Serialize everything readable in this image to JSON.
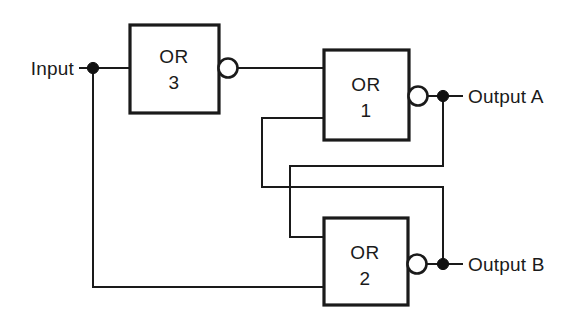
{
  "diagram": {
    "type": "logic-circuit",
    "background_color": "#ffffff",
    "line_color": "#1a1a1a",
    "gates": [
      {
        "id": "or3",
        "label_line1": "OR",
        "label_line2": "3",
        "x": 130,
        "y": 25,
        "width": 89,
        "height": 88,
        "inverting_output": true,
        "inputs": 1
      },
      {
        "id": "or1",
        "label_line1": "OR",
        "label_line2": "1",
        "x": 324,
        "y": 50,
        "width": 85,
        "height": 90,
        "inverting_output": true,
        "inputs": 2
      },
      {
        "id": "or2",
        "label_line1": "OR",
        "label_line2": "2",
        "x": 324,
        "y": 218,
        "width": 84,
        "height": 87,
        "inverting_output": true,
        "inputs": 2
      }
    ],
    "ports": [
      {
        "id": "input",
        "label": "Input",
        "side": "left",
        "x": 80,
        "y": 68
      },
      {
        "id": "output_a",
        "label": "Output A",
        "side": "right",
        "x": 468,
        "y": 96
      },
      {
        "id": "output_b",
        "label": "Output B",
        "side": "right",
        "x": 468,
        "y": 264
      }
    ],
    "junctions": [
      {
        "id": "input-junction",
        "x": 93,
        "y": 68
      },
      {
        "id": "output-a-junction",
        "x": 443,
        "y": 96
      },
      {
        "id": "output-b-junction",
        "x": 443,
        "y": 264
      }
    ]
  }
}
